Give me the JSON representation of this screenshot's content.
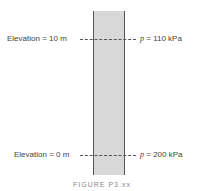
{
  "diagram": {
    "top": {
      "elevation_label": "Elevation = 10 m",
      "pressure_symbol": "p",
      "pressure_value": "= 110 kPa"
    },
    "bottom": {
      "elevation_label": "Elevation = 0 m",
      "pressure_symbol": "p",
      "pressure_value": "= 200 kPa"
    },
    "caption": "FIGURE P3.xx",
    "colors": {
      "column_fill": "#d8d8d8",
      "column_border": "#555555",
      "text": "#444444"
    }
  }
}
